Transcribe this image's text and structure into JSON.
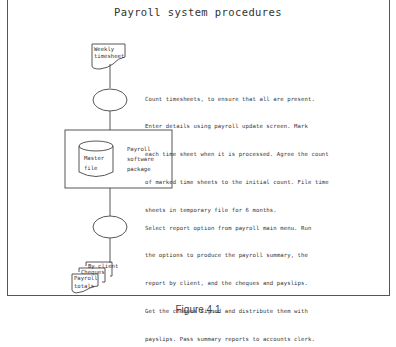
{
  "title": "Payroll system procedures",
  "nodes": {
    "weekly_timesheet": {
      "line1": "Weekly",
      "line2": "timesheet"
    },
    "master_file": {
      "line1": "Master",
      "line2": "file"
    },
    "software_package": {
      "line1": "Payroll",
      "line2": "software",
      "line3": "package"
    },
    "outputs": {
      "by_client": "By client",
      "cheques": "Cheques",
      "payroll_totals_1": "Payroll",
      "payroll_totals_2": "totals"
    }
  },
  "steps": [
    {
      "lines": [
        "Count timesheets, to ensure that all are present.",
        "Enter details using payroll update screen. Mark",
        "each time sheet when it is processed. Agree the count",
        "of marked time sheets to the initial count. File time",
        "sheets in temporary file for 6 months."
      ]
    },
    {
      "lines": [
        "Select report option from payroll main menu. Run",
        "the options to produce the payroll summary, the",
        "report by client, and the cheques and payslips.",
        "Get the cheques signed and distribute them with",
        "payslips. Pass summary reports to accounts clerk."
      ]
    }
  ],
  "caption": "Figure 4.1",
  "colors": {
    "line": "#444444",
    "frame": "#555555",
    "background": "#ffffff"
  }
}
